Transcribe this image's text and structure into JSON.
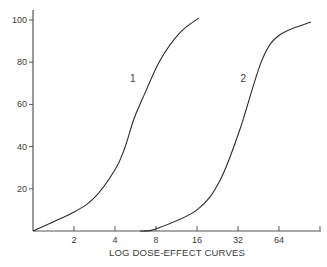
{
  "chart_data": {
    "type": "line",
    "title": "LOG DOSE-EFFECT CURVES",
    "xlabel": "LOG DOSE-EFFECT CURVES",
    "ylabel": "",
    "x_scale": "log2",
    "xlim": [
      1,
      128
    ],
    "ylim": [
      0,
      100
    ],
    "x_ticks": [
      2,
      4,
      8,
      16,
      32,
      64,
      128
    ],
    "x_tick_labels": [
      "2",
      "4",
      "8",
      "16",
      "32",
      "64",
      ""
    ],
    "y_ticks": [
      20,
      40,
      60,
      80,
      100
    ],
    "y_tick_labels": [
      "20",
      "40",
      "60",
      "80",
      "100"
    ],
    "grid": false,
    "legend": "none (curves labeled inline)",
    "series": [
      {
        "name": "1",
        "label_position": {
          "x": 5.4,
          "y": 72
        },
        "points": [
          {
            "x": 1.0,
            "y": 0
          },
          {
            "x": 2.0,
            "y": 9
          },
          {
            "x": 2.85,
            "y": 16
          },
          {
            "x": 4.0,
            "y": 29
          },
          {
            "x": 4.7,
            "y": 39
          },
          {
            "x": 5.5,
            "y": 53
          },
          {
            "x": 6.4,
            "y": 63
          },
          {
            "x": 8.6,
            "y": 81
          },
          {
            "x": 12.0,
            "y": 94
          },
          {
            "x": 16.5,
            "y": 101
          }
        ]
      },
      {
        "name": "2",
        "label_position": {
          "x": 35.0,
          "y": 72
        },
        "points": [
          {
            "x": 6.1,
            "y": 0
          },
          {
            "x": 8.0,
            "y": 1
          },
          {
            "x": 16.0,
            "y": 10
          },
          {
            "x": 23.6,
            "y": 24
          },
          {
            "x": 33.0,
            "y": 48
          },
          {
            "x": 48.0,
            "y": 81
          },
          {
            "x": 65.0,
            "y": 93
          },
          {
            "x": 110.0,
            "y": 99
          }
        ]
      }
    ]
  },
  "colors": {
    "axis": "#555555",
    "curve": "#2a2a2a",
    "text": "#3a3a3a",
    "background": "#ffffff"
  }
}
